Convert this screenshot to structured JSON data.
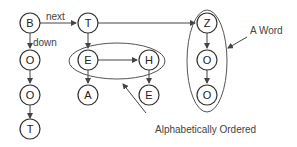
{
  "diagram": {
    "nodes": [
      {
        "id": "b",
        "label": "B"
      },
      {
        "id": "o1",
        "label": "O"
      },
      {
        "id": "o2",
        "label": "O"
      },
      {
        "id": "t1",
        "label": "T"
      },
      {
        "id": "t2",
        "label": "T"
      },
      {
        "id": "e1",
        "label": "E"
      },
      {
        "id": "a",
        "label": "A"
      },
      {
        "id": "h",
        "label": "H"
      },
      {
        "id": "e2",
        "label": "E"
      },
      {
        "id": "z",
        "label": "Z"
      },
      {
        "id": "o3",
        "label": "O"
      },
      {
        "id": "o4",
        "label": "O"
      }
    ],
    "edge_labels": {
      "next": "next",
      "down": "down"
    },
    "annotations": {
      "word": "A Word",
      "ordered": "Alphabetically Ordered"
    }
  }
}
